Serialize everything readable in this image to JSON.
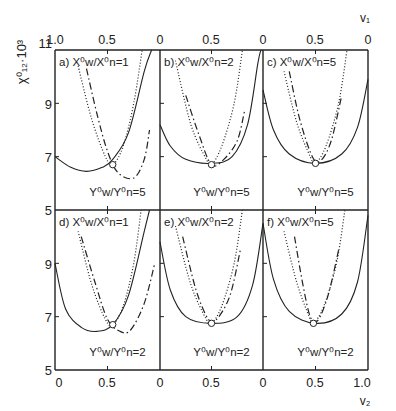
{
  "chart_data": {
    "type": "line",
    "title": "",
    "ylabel": "χ⁰₁₂·10³",
    "xlabel_bottom": "v₂",
    "xlabel_top": "v₁",
    "ylim": [
      5,
      11
    ],
    "yticks": [
      "5",
      "7",
      "9",
      "11"
    ],
    "xticks_bottom": [
      "0",
      "0.5",
      "1.0"
    ],
    "xticks_top": [
      "1.0",
      "0.5",
      "0"
    ],
    "grid": false,
    "legend": "none",
    "panels": [
      {
        "id": "a",
        "label": "a) X⁰w/X⁰n=1",
        "note": "Y⁰w/Y⁰n=5",
        "critical_point": [
          0.55,
          6.7
        ],
        "series": [
          {
            "name": "solid",
            "points": [
              [
                0.0,
                7.0
              ],
              [
                0.15,
                6.6
              ],
              [
                0.3,
                6.45
              ],
              [
                0.45,
                6.6
              ],
              [
                0.55,
                6.9
              ],
              [
                0.7,
                7.9
              ],
              [
                0.85,
                10.2
              ],
              [
                0.92,
                11
              ]
            ]
          },
          {
            "name": "dotted",
            "points": [
              [
                0.22,
                10.4
              ],
              [
                0.35,
                8.4
              ],
              [
                0.48,
                7.0
              ],
              [
                0.55,
                6.7
              ],
              [
                0.65,
                7.4
              ],
              [
                0.75,
                9.0
              ],
              [
                0.83,
                11
              ]
            ]
          },
          {
            "name": "dash-dot",
            "points": [
              [
                0.3,
                10.3
              ],
              [
                0.4,
                8.6
              ],
              [
                0.5,
                7.2
              ],
              [
                0.6,
                6.4
              ],
              [
                0.75,
                6.2
              ],
              [
                0.85,
                6.9
              ],
              [
                0.9,
                8.0
              ]
            ]
          }
        ]
      },
      {
        "id": "b",
        "label": "b) X⁰w/X⁰n=2",
        "note": "Y⁰w/Y⁰n=5",
        "critical_point": [
          0.5,
          6.7
        ],
        "series": [
          {
            "name": "solid",
            "points": [
              [
                0.0,
                8.2
              ],
              [
                0.1,
                7.4
              ],
              [
                0.25,
                6.9
              ],
              [
                0.5,
                6.75
              ],
              [
                0.7,
                7.0
              ],
              [
                0.85,
                8.2
              ],
              [
                0.95,
                10.5
              ],
              [
                0.98,
                11
              ]
            ]
          },
          {
            "name": "dotted",
            "points": [
              [
                0.15,
                10.6
              ],
              [
                0.3,
                8.2
              ],
              [
                0.45,
                6.9
              ],
              [
                0.5,
                6.7
              ],
              [
                0.6,
                7.4
              ],
              [
                0.72,
                9.0
              ],
              [
                0.8,
                11
              ]
            ]
          },
          {
            "name": "dash-dot",
            "points": [
              [
                0.25,
                9.3
              ],
              [
                0.38,
                7.8
              ],
              [
                0.5,
                6.7
              ],
              [
                0.62,
                6.9
              ],
              [
                0.75,
                7.6
              ],
              [
                0.82,
                8.7
              ]
            ]
          }
        ]
      },
      {
        "id": "c",
        "label": "c) X⁰w/X⁰n=5",
        "note": "Y⁰w/Y⁰n=5",
        "critical_point": [
          0.5,
          6.75
        ],
        "series": [
          {
            "name": "solid",
            "points": [
              [
                0.0,
                9.5
              ],
              [
                0.1,
                8.0
              ],
              [
                0.25,
                7.1
              ],
              [
                0.5,
                6.75
              ],
              [
                0.75,
                7.1
              ],
              [
                0.9,
                8.1
              ],
              [
                1.0,
                9.9
              ]
            ]
          },
          {
            "name": "dotted",
            "points": [
              [
                0.2,
                10.2
              ],
              [
                0.32,
                8.3
              ],
              [
                0.45,
                7.0
              ],
              [
                0.5,
                6.75
              ],
              [
                0.6,
                7.4
              ],
              [
                0.72,
                9.0
              ],
              [
                0.8,
                11
              ]
            ]
          },
          {
            "name": "dash-dot",
            "points": [
              [
                0.25,
                10.2
              ],
              [
                0.35,
                8.4
              ],
              [
                0.47,
                7.0
              ],
              [
                0.55,
                6.85
              ],
              [
                0.65,
                7.6
              ],
              [
                0.75,
                9.3
              ]
            ]
          }
        ]
      },
      {
        "id": "d",
        "label": "d) X⁰w/X⁰n=1",
        "note": "Y⁰w/Y⁰n=2",
        "critical_point": [
          0.55,
          6.7
        ],
        "series": [
          {
            "name": "solid",
            "points": [
              [
                0.0,
                9.0
              ],
              [
                0.1,
                7.3
              ],
              [
                0.25,
                6.6
              ],
              [
                0.4,
                6.45
              ],
              [
                0.55,
                6.7
              ],
              [
                0.7,
                7.8
              ],
              [
                0.85,
                10.2
              ],
              [
                0.9,
                11
              ]
            ]
          },
          {
            "name": "dotted",
            "points": [
              [
                0.22,
                10.2
              ],
              [
                0.35,
                8.2
              ],
              [
                0.48,
                6.9
              ],
              [
                0.55,
                6.7
              ],
              [
                0.65,
                7.4
              ],
              [
                0.75,
                9.0
              ],
              [
                0.82,
                11
              ]
            ]
          },
          {
            "name": "dash-dot",
            "points": [
              [
                0.25,
                10.0
              ],
              [
                0.38,
                8.3
              ],
              [
                0.5,
                6.9
              ],
              [
                0.62,
                6.45
              ],
              [
                0.72,
                6.5
              ],
              [
                0.85,
                7.5
              ],
              [
                0.95,
                9.0
              ]
            ]
          }
        ]
      },
      {
        "id": "e",
        "label": "e) X⁰w/X⁰n=2",
        "note": "Y⁰w/Y⁰n=2",
        "critical_point": [
          0.5,
          6.75
        ],
        "series": [
          {
            "name": "solid",
            "points": [
              [
                0.0,
                9.8
              ],
              [
                0.1,
                8.0
              ],
              [
                0.25,
                7.0
              ],
              [
                0.5,
                6.75
              ],
              [
                0.75,
                7.0
              ],
              [
                0.9,
                8.2
              ],
              [
                1.0,
                10.5
              ]
            ]
          },
          {
            "name": "dotted",
            "points": [
              [
                0.15,
                10.4
              ],
              [
                0.3,
                8.2
              ],
              [
                0.45,
                6.9
              ],
              [
                0.5,
                6.75
              ],
              [
                0.6,
                7.4
              ],
              [
                0.72,
                9.0
              ],
              [
                0.8,
                11
              ]
            ]
          },
          {
            "name": "dash-dot",
            "points": [
              [
                0.22,
                10.0
              ],
              [
                0.35,
                8.0
              ],
              [
                0.47,
                6.9
              ],
              [
                0.55,
                6.9
              ],
              [
                0.68,
                7.8
              ],
              [
                0.78,
                9.5
              ]
            ]
          }
        ]
      },
      {
        "id": "f",
        "label": "f) X⁰w/X⁰n=5",
        "note": "Y⁰w/Y⁰n=2",
        "critical_point": [
          0.48,
          6.75
        ],
        "series": [
          {
            "name": "solid",
            "points": [
              [
                0.0,
                10.5
              ],
              [
                0.1,
                8.4
              ],
              [
                0.25,
                7.2
              ],
              [
                0.5,
                6.75
              ],
              [
                0.75,
                7.1
              ],
              [
                0.9,
                8.3
              ],
              [
                1.0,
                10.8
              ]
            ]
          },
          {
            "name": "dotted",
            "points": [
              [
                0.2,
                10.2
              ],
              [
                0.32,
                8.3
              ],
              [
                0.44,
                7.0
              ],
              [
                0.48,
                6.75
              ],
              [
                0.58,
                7.4
              ],
              [
                0.7,
                9.0
              ],
              [
                0.78,
                11
              ]
            ]
          },
          {
            "name": "dash-dot",
            "points": [
              [
                0.3,
                10.0
              ],
              [
                0.38,
                8.2
              ],
              [
                0.45,
                7.0
              ],
              [
                0.52,
                6.85
              ],
              [
                0.62,
                7.8
              ],
              [
                0.72,
                9.5
              ]
            ]
          }
        ]
      }
    ]
  },
  "figure": {
    "ylabel": "χ⁰₁₂·10³",
    "top_axis_label": "v₁",
    "bottom_axis_label": "v₂",
    "yticks_top": [
      "11",
      "9",
      "7",
      "5"
    ],
    "yticks_bottom": [
      "9",
      "7",
      "5"
    ],
    "top_xticks": [
      "1.0",
      "0.5",
      "0",
      "0.5",
      "0",
      "0.5",
      "0"
    ],
    "bottom_xticks": [
      "0",
      "0.5",
      "0",
      "0.5",
      "0",
      "0.5",
      "1.0"
    ],
    "panel_labels": [
      "a) X⁰w/X⁰n=1",
      "b) X⁰w/X⁰n=2",
      "c) X⁰w/X⁰n=5",
      "d) X⁰w/X⁰n=1",
      "e) X⁰w/X⁰n=2",
      "f) X⁰w/X⁰n=5"
    ],
    "panel_notes": [
      "Y⁰w/Y⁰n=5",
      "Y⁰w/Y⁰n=5",
      "Y⁰w/Y⁰n=5",
      "Y⁰w/Y⁰n=2",
      "Y⁰w/Y⁰n=2",
      "Y⁰w/Y⁰n=2"
    ]
  }
}
